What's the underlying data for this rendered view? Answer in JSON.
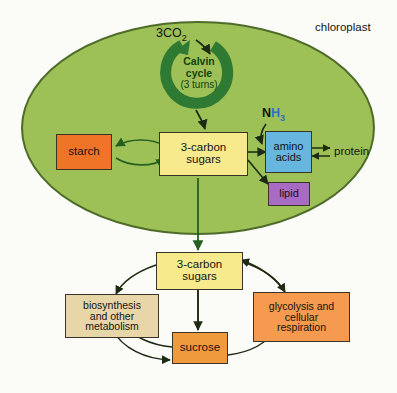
{
  "diagram": {
    "title_label": "chloroplast",
    "compartment": {
      "name": "chloroplast",
      "fill_color": "#9dc057",
      "stroke_color": "#4f6b2a"
    },
    "calvin": {
      "line1": "Calvin",
      "line2": "cycle",
      "line3": "(3 turns)",
      "color": "#2f7a32",
      "input_label": "3CO",
      "input_sub": "2"
    },
    "ammonia": {
      "n": "N",
      "h": "H",
      "sub": "3",
      "n_color": "#141414",
      "h_color": "#2f6fd0"
    },
    "boxes": {
      "starch": {
        "label": "starch",
        "color": "#ef7428"
      },
      "sugars_in": {
        "line1": "3-carbon",
        "line2": "sugars",
        "color": "#f6ea8c"
      },
      "amino_acids": {
        "line1": "amino",
        "line2": "acids",
        "color": "#66b6e0"
      },
      "lipid": {
        "label": "lipid",
        "color": "#a museum"
      },
      "lipid_fixed": {
        "label": "lipid",
        "color": "#a76bc4"
      },
      "sugars_out": {
        "line1": "3-carbon",
        "line2": "sugars",
        "color": "#f6ea8c"
      },
      "biosynthesis": {
        "line1": "biosynthesis",
        "line2": "and other",
        "line3": "metabolism",
        "color": "#e8d6a8"
      },
      "glycolysis": {
        "line1": "glycolysis and",
        "line2": "cellular",
        "line3": "respiration",
        "color": "#f59a4e"
      },
      "sucrose": {
        "label": "sucrose",
        "color": "#f09a3e"
      }
    },
    "protein_label": "protein",
    "arrow_color": "#1d2b12",
    "dark_arrow_color": "#24601f"
  }
}
